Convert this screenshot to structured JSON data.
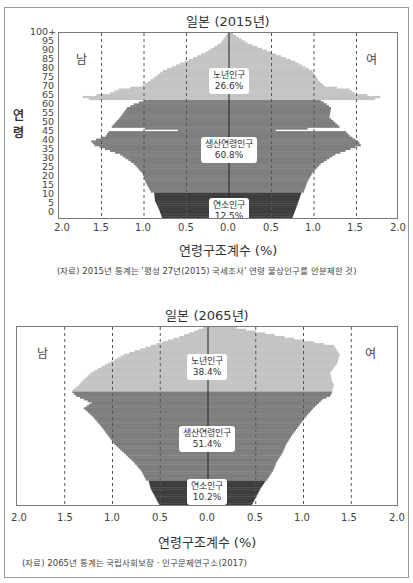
{
  "colors": {
    "old": "#c3c3c3",
    "working": "#7e7e7e",
    "youth": "#3e3e3e",
    "grid": "#555555",
    "center": "#222222"
  },
  "chart_data": [
    {
      "type": "bar",
      "subtype": "population-pyramid",
      "title": "일본 (2015년)",
      "xlabel": "연령구조계수 (%)",
      "ylabel": "연령",
      "x_ticks": [
        "2.0",
        "1.5",
        "1.0",
        "0.5",
        "0.0",
        "0.5",
        "1.0",
        "1.5",
        "2.0"
      ],
      "y_ticks": [
        "0",
        "5",
        "10",
        "15",
        "20",
        "25",
        "30",
        "35",
        "40",
        "45",
        "50",
        "55",
        "60",
        "65",
        "70",
        "75",
        "80",
        "85",
        "90",
        "95",
        "100+"
      ],
      "xlim": [
        -2.0,
        2.0
      ],
      "ylim": [
        0,
        100
      ],
      "grid": "vertical dashed at ±0.5, ±1.0, ±1.5",
      "sex_labels": {
        "left": "남",
        "right": "여"
      },
      "segments": [
        {
          "name": "노년인구",
          "share": "26.6%",
          "age_range": [
            65,
            100
          ]
        },
        {
          "name": "생산연령인구",
          "share": "60.8%",
          "age_range": [
            15,
            64
          ]
        },
        {
          "name": "연소인구",
          "share": "12.5%",
          "age_range": [
            0,
            14
          ]
        }
      ],
      "series": [
        {
          "name": "남",
          "ages": [
            0,
            5,
            10,
            14,
            15,
            20,
            25,
            30,
            35,
            40,
            42,
            45,
            47,
            48,
            50,
            55,
            60,
            62,
            64,
            65,
            66,
            68,
            70,
            72,
            75,
            80,
            85,
            90,
            95,
            100
          ],
          "values": [
            0.78,
            0.82,
            0.87,
            0.88,
            0.92,
            0.98,
            1.02,
            1.12,
            1.28,
            1.58,
            1.62,
            1.45,
            1.42,
            0.6,
            1.38,
            1.28,
            1.2,
            1.12,
            1.0,
            1.65,
            1.72,
            1.4,
            1.3,
            1.02,
            0.92,
            0.78,
            0.52,
            0.28,
            0.1,
            0.02
          ]
        },
        {
          "name": "여",
          "ages": [
            0,
            5,
            10,
            14,
            15,
            20,
            25,
            30,
            35,
            40,
            42,
            45,
            47,
            48,
            50,
            55,
            60,
            62,
            64,
            65,
            66,
            68,
            70,
            72,
            75,
            80,
            85,
            90,
            95,
            100
          ],
          "values": [
            0.74,
            0.78,
            0.82,
            0.85,
            0.88,
            0.92,
            0.98,
            1.08,
            1.25,
            1.55,
            1.52,
            1.42,
            1.38,
            0.55,
            1.3,
            1.18,
            1.2,
            1.15,
            1.08,
            1.72,
            1.78,
            1.48,
            1.42,
            1.12,
            1.05,
            0.98,
            0.78,
            0.5,
            0.22,
            0.05
          ]
        }
      ],
      "source": "(자료) 2015년 통계는 '평성 27년(2015) 국세조사' 연령 불상인구를 안분제한 것)"
    },
    {
      "type": "bar",
      "subtype": "population-pyramid",
      "title": "일본 (2065년)",
      "xlabel": "연령구조계수 (%)",
      "x_ticks": [
        "2.0",
        "1.5",
        "1.0",
        "0.5",
        "0.0",
        "0.5",
        "1.0",
        "1.5",
        "2.0"
      ],
      "xlim": [
        -2.0,
        2.0
      ],
      "ylim": [
        0,
        100
      ],
      "grid": "vertical dashed at ±0.5, ±1.0, ±1.5",
      "sex_labels": {
        "left": "남",
        "right": "여"
      },
      "segments": [
        {
          "name": "노년인구",
          "share": "38.4%",
          "age_range": [
            65,
            100
          ]
        },
        {
          "name": "생산연령인구",
          "share": "51.4%",
          "age_range": [
            15,
            64
          ]
        },
        {
          "name": "연소인구",
          "share": "10.2%",
          "age_range": [
            0,
            14
          ]
        }
      ],
      "series": [
        {
          "name": "남",
          "ages": [
            0,
            5,
            10,
            14,
            15,
            20,
            25,
            30,
            35,
            40,
            45,
            50,
            55,
            58,
            60,
            62,
            64,
            65,
            68,
            70,
            75,
            80,
            85,
            90,
            95,
            100
          ],
          "values": [
            0.5,
            0.55,
            0.6,
            0.62,
            0.65,
            0.7,
            0.78,
            0.88,
            0.98,
            1.05,
            1.12,
            1.2,
            1.3,
            1.22,
            1.3,
            1.38,
            1.42,
            1.42,
            1.35,
            1.32,
            1.22,
            1.05,
            0.88,
            0.6,
            0.3,
            0.05
          ]
        },
        {
          "name": "여",
          "ages": [
            0,
            5,
            10,
            14,
            15,
            20,
            25,
            30,
            35,
            40,
            45,
            50,
            55,
            60,
            62,
            64,
            65,
            68,
            70,
            75,
            80,
            85,
            90,
            95,
            100
          ],
          "values": [
            0.45,
            0.5,
            0.55,
            0.6,
            0.62,
            0.68,
            0.72,
            0.78,
            0.82,
            0.88,
            0.95,
            1.02,
            1.1,
            1.2,
            1.28,
            1.3,
            1.3,
            1.32,
            1.3,
            1.28,
            1.35,
            1.38,
            1.32,
            0.8,
            0.3
          ]
        }
      ],
      "source": "(자료) 2065년 통계는 국립사회보장 · 인구문제연구소(2017)"
    }
  ]
}
